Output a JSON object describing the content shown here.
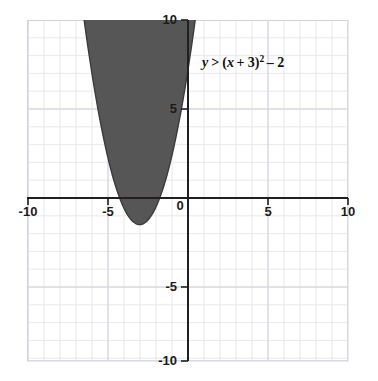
{
  "figure": {
    "kind": "coordinate-graph",
    "background_color": "#ffffff",
    "grid_color": "#dcdce4",
    "grid_major_color": "#cfcfdb",
    "axis_color": "#231f20",
    "border_color": "#d3d3dd",
    "shade_color": "#565656",
    "curve_color": "#3b3b3b"
  },
  "equation_label": {
    "text": "y > (x + 3)² – 2",
    "parts": {
      "y": "y",
      "relation": ">",
      "open": "(",
      "x": "x",
      "plus": "+ 3",
      "close": ")",
      "exponent": "2",
      "tail": "– 2"
    }
  },
  "axes": {
    "x_label_values": [
      "-10",
      "-5",
      "0",
      "5",
      "10"
    ],
    "y_label_values": [
      "10",
      "5",
      "-5",
      "-10"
    ],
    "x_min": -10,
    "x_max": 10,
    "y_min": -10,
    "y_max": 10,
    "tick_step": 5,
    "grid_step": 1
  },
  "chart_data": {
    "type": "area",
    "title": "",
    "subtitle": "",
    "xlabel": "",
    "ylabel": "",
    "xlim": [
      -10,
      10
    ],
    "ylim": [
      -10,
      10
    ],
    "grid": true,
    "legend": "none",
    "annotations": [
      {
        "text": "y > (x + 3)² – 2",
        "x": 0.9,
        "y": 7.6
      }
    ],
    "xticks": [
      -10,
      -5,
      0,
      5,
      10
    ],
    "xtick_labels": [
      "-10",
      "-5",
      "0",
      "5",
      "10"
    ],
    "yticks": [
      -10,
      -5,
      0,
      5,
      10
    ],
    "ytick_labels": [
      "-10",
      "-5",
      "",
      "5",
      "10"
    ],
    "series": [
      {
        "name": "y = (x + 3)^2 - 2",
        "type": "parabola",
        "vertex": [
          -3,
          -2
        ],
        "a": 1,
        "h": -3,
        "k": -2,
        "inequality": ">",
        "shaded_side": "above",
        "boundary_style": "solid-drawn-as-edge",
        "x_at_y_top": [
          -6.464,
          0.464
        ],
        "x_intercepts": [
          -4.414,
          -1.586
        ],
        "y_intercept": 7,
        "points": [
          {
            "x": -6.5,
            "y": 10.25
          },
          {
            "x": -6,
            "y": 7
          },
          {
            "x": -5,
            "y": 2
          },
          {
            "x": -4.414,
            "y": 0
          },
          {
            "x": -4,
            "y": -1
          },
          {
            "x": -3,
            "y": -2
          },
          {
            "x": -2,
            "y": -1
          },
          {
            "x": -1.586,
            "y": 0
          },
          {
            "x": -1,
            "y": 2
          },
          {
            "x": 0,
            "y": 7
          },
          {
            "x": 0.5,
            "y": 10.25
          }
        ]
      }
    ]
  }
}
